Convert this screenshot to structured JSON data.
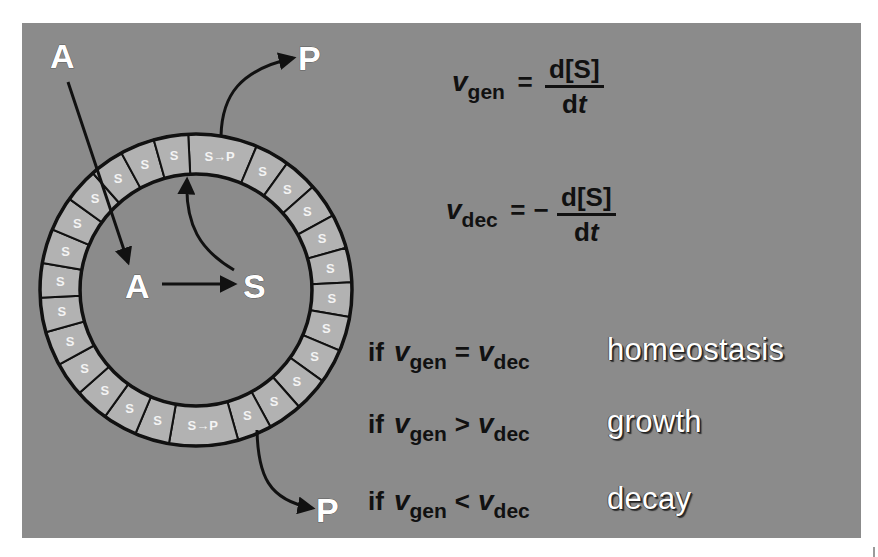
{
  "diagram": {
    "labels": {
      "outer_A": "A",
      "top_P": "P",
      "inner_A": "A",
      "inner_S": "S",
      "bottom_P": "P"
    },
    "ring": {
      "cell_label": "S",
      "conversion_label_top": "S→P",
      "conversion_label_bottom": "S→P",
      "cell_count": 26
    },
    "colors": {
      "background": "#8b8b8b",
      "ring_cell": "#b2b2b2",
      "outline": "#111111",
      "label": "#ffffff"
    }
  },
  "equations": {
    "gen": {
      "symbol": "v",
      "subscript": "gen",
      "equals": "=",
      "numerator": "d[S]",
      "den_d": "d",
      "den_t": "t"
    },
    "dec": {
      "symbol": "v",
      "subscript": "dec",
      "equals": "=",
      "minus": "−",
      "numerator": "d[S]",
      "den_d": "d",
      "den_t": "t"
    }
  },
  "conditions": [
    {
      "if": "if",
      "lhs_symbol": "v",
      "lhs_sub": "gen",
      "op": "=",
      "rhs_symbol": "v",
      "rhs_sub": "dec",
      "result": "homeostasis"
    },
    {
      "if": "if",
      "lhs_symbol": "v",
      "lhs_sub": "gen",
      "op": ">",
      "rhs_symbol": "v",
      "rhs_sub": "dec",
      "result": "growth"
    },
    {
      "if": "if",
      "lhs_symbol": "v",
      "lhs_sub": "gen",
      "op": "<",
      "rhs_symbol": "v",
      "rhs_sub": "dec",
      "result": "decay"
    }
  ]
}
